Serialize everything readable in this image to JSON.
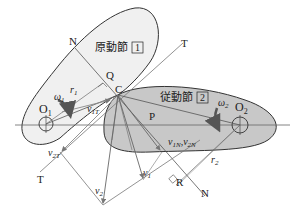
{
  "bodies": {
    "driver": {
      "label": "原動節",
      "number": "1",
      "fill": "#f0f0f0"
    },
    "follower": {
      "label": "従動節",
      "number": "2",
      "fill": "#c8c8c8"
    }
  },
  "points": {
    "O1": "O",
    "O1_sub": "1",
    "O2": "O",
    "O2_sub": "2",
    "C": "C",
    "P": "P",
    "Q": "Q",
    "R": "R",
    "N_top": "N",
    "N_bottom": "N",
    "T_top": "T",
    "T_bottom": "T"
  },
  "labels": {
    "omega1": "ω",
    "omega1_sub": "1",
    "omega2": "ω",
    "omega2_sub": "2",
    "r1": "r",
    "r1_sub": "1",
    "r2": "r",
    "r2_sub": "2",
    "v1": "v",
    "v1_sub": "1",
    "v2": "v",
    "v2_sub": "2",
    "v1T": "v",
    "v1T_sub": "1T",
    "v2T": "v",
    "v2T_sub": "2T",
    "vN_a": "v",
    "vN_a_sub": "1N",
    "vN_sep": ",",
    "vN_b": "v",
    "vN_b_sub": "2N"
  },
  "colors": {
    "line": "#555555",
    "arrow": "#777777",
    "outline": "#333333"
  }
}
